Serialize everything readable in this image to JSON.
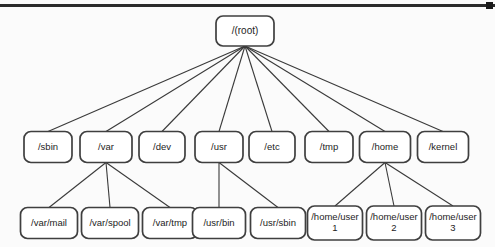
{
  "diagram": {
    "background_color": "#fbfbfb",
    "node_fill": "#ffffff",
    "node_stroke": "#3f3f3f",
    "edge_color": "#3a3a3a",
    "top_border_color": "#2b2b2b"
  },
  "nodes": {
    "root": {
      "label": "/(root)",
      "x": 245,
      "y": 31,
      "w": 58,
      "h": 30
    },
    "level2": [
      {
        "id": "sbin",
        "label": "/sbin",
        "x": 48,
        "y": 147,
        "w": 48,
        "h": 31
      },
      {
        "id": "var",
        "label": "/var",
        "x": 106,
        "y": 147,
        "w": 52,
        "h": 31
      },
      {
        "id": "dev",
        "label": "/dev",
        "x": 162,
        "y": 147,
        "w": 46,
        "h": 31
      },
      {
        "id": "usr",
        "label": "/usr",
        "x": 219,
        "y": 147,
        "w": 48,
        "h": 31
      },
      {
        "id": "etc",
        "label": "/etc",
        "x": 272,
        "y": 147,
        "w": 46,
        "h": 31
      },
      {
        "id": "tmp",
        "label": "/tmp",
        "x": 329,
        "y": 147,
        "w": 48,
        "h": 31
      },
      {
        "id": "home",
        "label": "/home",
        "x": 385,
        "y": 147,
        "w": 51,
        "h": 31
      },
      {
        "id": "kernel",
        "label": "/kernel",
        "x": 443,
        "y": 147,
        "w": 51,
        "h": 31
      }
    ],
    "level3": [
      {
        "id": "var-mail",
        "label": "/var/mail",
        "line1": "/var/mail",
        "line2": "",
        "parent": "var",
        "x": 49,
        "y": 223,
        "w": 57,
        "h": 31
      },
      {
        "id": "var-spool",
        "label": "/var/spool",
        "line1": "/var/spool",
        "line2": "",
        "parent": "var",
        "x": 110,
        "y": 223,
        "w": 57,
        "h": 31
      },
      {
        "id": "var-tmp",
        "label": "/var/tmp",
        "line1": "/var/tmp",
        "line2": "",
        "parent": "var",
        "x": 170,
        "y": 223,
        "w": 55,
        "h": 31
      },
      {
        "id": "usr-bin",
        "label": "/usr/bin",
        "line1": "/usr/bin",
        "line2": "",
        "parent": "usr",
        "x": 219,
        "y": 223,
        "w": 53,
        "h": 31
      },
      {
        "id": "usr-sbin",
        "label": "/usr/sbin",
        "line1": "/usr/sbin",
        "line2": "",
        "parent": "usr",
        "x": 278,
        "y": 223,
        "w": 55,
        "h": 31
      },
      {
        "id": "home-user1",
        "label": "/home/user 1",
        "line1": "/home/user",
        "line2": "1",
        "parent": "home",
        "x": 335,
        "y": 223,
        "w": 55,
        "h": 34
      },
      {
        "id": "home-user2",
        "label": "/home/user 2",
        "line1": "/home/user",
        "line2": "2",
        "parent": "home",
        "x": 394,
        "y": 223,
        "w": 55,
        "h": 34
      },
      {
        "id": "home-user3",
        "label": "/home/user 3",
        "line1": "/home/user",
        "line2": "3",
        "parent": "home",
        "x": 453,
        "y": 223,
        "w": 55,
        "h": 34
      }
    ]
  }
}
